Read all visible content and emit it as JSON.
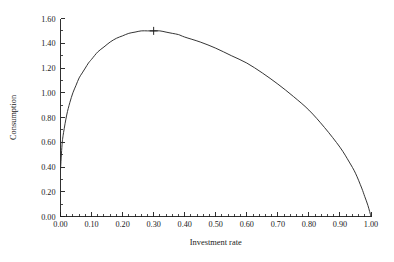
{
  "chart_data": {
    "type": "line",
    "title": "",
    "subtitle": "",
    "xlabel": "Investment rate",
    "ylabel": "Consumption",
    "xlim": [
      0.0,
      1.0
    ],
    "ylim": [
      0.0,
      1.6
    ],
    "grid": false,
    "legend": null,
    "legend_position": "none",
    "x_ticks": [
      "0.00",
      "0.10",
      "0.20",
      "0.30",
      "0.40",
      "0.50",
      "0.60",
      "0.70",
      "0.80",
      "0.90",
      "1.00"
    ],
    "x_tick_values": [
      0.0,
      0.1,
      0.2,
      0.3,
      0.4,
      0.5,
      0.6,
      0.7,
      0.8,
      0.9,
      1.0
    ],
    "x_minor_ticks_per_interval": 5,
    "y_ticks": [
      "0.00",
      "0.20",
      "0.40",
      "0.60",
      "0.80",
      "1.00",
      "1.20",
      "1.40",
      "1.60"
    ],
    "y_tick_values": [
      0.0,
      0.2,
      0.4,
      0.6,
      0.8,
      1.0,
      1.2,
      1.4,
      1.6
    ],
    "y_minor_ticks_per_interval": 2,
    "series": [
      {
        "name": "Consumption",
        "color": "#2a2a2a",
        "x": [
          0.0,
          0.005,
          0.01,
          0.02,
          0.03,
          0.04,
          0.05,
          0.06,
          0.07,
          0.08,
          0.09,
          0.1,
          0.12,
          0.14,
          0.16,
          0.18,
          0.2,
          0.22,
          0.24,
          0.26,
          0.28,
          0.3,
          0.32,
          0.34,
          0.36,
          0.38,
          0.4,
          0.45,
          0.5,
          0.55,
          0.6,
          0.65,
          0.7,
          0.75,
          0.8,
          0.85,
          0.9,
          0.93,
          0.95,
          0.97,
          0.98,
          0.99,
          1.0
        ],
        "y": [
          0.38,
          0.58,
          0.68,
          0.82,
          0.92,
          1.0,
          1.06,
          1.12,
          1.16,
          1.2,
          1.24,
          1.27,
          1.33,
          1.37,
          1.41,
          1.44,
          1.46,
          1.48,
          1.49,
          1.5,
          1.5,
          1.5,
          1.5,
          1.49,
          1.48,
          1.47,
          1.45,
          1.41,
          1.36,
          1.3,
          1.24,
          1.16,
          1.07,
          0.97,
          0.86,
          0.72,
          0.56,
          0.44,
          0.35,
          0.23,
          0.16,
          0.09,
          0.0
        ]
      }
    ],
    "annotations": [
      {
        "name": "peak-marker",
        "symbol": "plus",
        "x": 0.3,
        "y": 1.5,
        "label": ""
      }
    ]
  },
  "axes": {
    "x_title": "Investment rate",
    "y_title": "Consumption"
  },
  "colors": {
    "curve": "#2a2a2a",
    "axis": "#1a1a1a",
    "background": "#ffffff"
  }
}
